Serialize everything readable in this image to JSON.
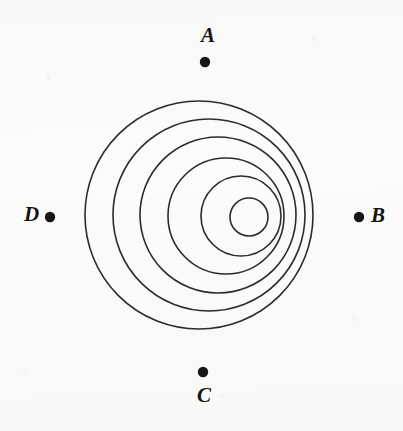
{
  "figure": {
    "background_color": "#fbfbfa",
    "stroke_color": "#2b2b2b",
    "dot_color": "#161616",
    "label_color": "#141414"
  },
  "labels": {
    "a": "A",
    "b": "B",
    "c": "C",
    "d": "D"
  },
  "chart_data": {
    "type": "scatter",
    "xlabel": "",
    "ylabel": "",
    "xlim": [
      0,
      403
    ],
    "ylim": [
      0,
      431
    ],
    "grid": false,
    "legend": "none",
    "wavefronts": [
      {
        "index": 1,
        "cx": 199,
        "cy": 215,
        "r": 114,
        "label": "outermost-wavefront"
      },
      {
        "index": 2,
        "cx": 209,
        "cy": 215,
        "r": 96,
        "label": "wavefront-2"
      },
      {
        "index": 3,
        "cx": 218,
        "cy": 215,
        "r": 78,
        "label": "wavefront-3"
      },
      {
        "index": 4,
        "cx": 226,
        "cy": 216,
        "r": 58,
        "label": "wavefront-4"
      },
      {
        "index": 5,
        "cx": 241,
        "cy": 216,
        "r": 40,
        "label": "wavefront-5"
      },
      {
        "index": 6,
        "cx": 249,
        "cy": 217,
        "r": 19,
        "label": "innermost-wavefront"
      }
    ],
    "points": [
      {
        "name": "A",
        "x": 205,
        "y": 62,
        "label_x": 208,
        "label_y": 36,
        "position": "top"
      },
      {
        "name": "B",
        "x": 359,
        "y": 217,
        "label_x": 378,
        "label_y": 216,
        "position": "right"
      },
      {
        "name": "C",
        "x": 203,
        "y": 372,
        "label_x": 204,
        "label_y": 396,
        "position": "bottom"
      },
      {
        "name": "D",
        "x": 50,
        "y": 217,
        "label_x": 31,
        "label_y": 215,
        "position": "left"
      }
    ],
    "annotations": [
      "Six nested circular wavefronts whose centers shift progressively rightward as the radius decreases",
      "Four labeled observation points A, B, C and D arranged around the wavefronts"
    ]
  }
}
